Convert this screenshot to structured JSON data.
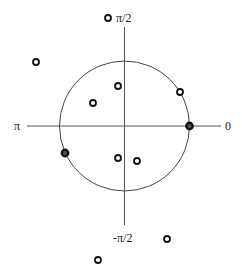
{
  "diagram": {
    "type": "unit-circle-pole-plot",
    "center": [
      124.5,
      126
    ],
    "radius": 65,
    "axes": {
      "horizontal": {
        "x1": 27,
        "x2": 221,
        "y": 126
      },
      "vertical": {
        "x": 124.5,
        "y1": 27,
        "y2": 225
      }
    },
    "labels": {
      "top": "π/2",
      "right": "0",
      "left": "π",
      "bottom": "-π/2"
    },
    "colors": {
      "line": "#555555",
      "marker": "#111111"
    },
    "points": [
      {
        "x": 108,
        "y": 18
      },
      {
        "x": 36,
        "y": 62
      },
      {
        "x": 118,
        "y": 86
      },
      {
        "x": 93,
        "y": 103
      },
      {
        "x": 180,
        "y": 92
      },
      {
        "x": 189.5,
        "y": 126,
        "bold": true
      },
      {
        "x": 65,
        "y": 153,
        "bold": true
      },
      {
        "x": 118,
        "y": 158
      },
      {
        "x": 137,
        "y": 161
      },
      {
        "x": 167,
        "y": 239
      },
      {
        "x": 98,
        "y": 260
      }
    ]
  }
}
